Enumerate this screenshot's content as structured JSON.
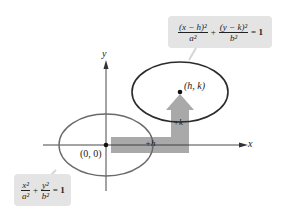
{
  "diagram": {
    "axes": {
      "x_label": "x",
      "y_label": "y"
    },
    "origin_label": "(0, 0)",
    "center_label": "(h, k)",
    "shift_horizontal_label": "+h",
    "shift_vertical_label": "+k",
    "standard_equation": {
      "term1_num": "x²",
      "term1_den": "a²",
      "plus": "+",
      "term2_num": "y²",
      "term2_den": "b²",
      "equals": "= 1"
    },
    "translated_equation": {
      "term1_num": "(x − h)²",
      "term1_den": "a²",
      "plus": "+",
      "term2_num": "(y − k)²",
      "term2_den": "b²",
      "equals": "= 1"
    },
    "colors": {
      "ellipse_original": "#6a6a6a",
      "ellipse_translated": "#2b2b2b",
      "arrow_fill": "#a9a9a9",
      "box_fill": "#e4e4e4",
      "axis": "#333333"
    }
  }
}
